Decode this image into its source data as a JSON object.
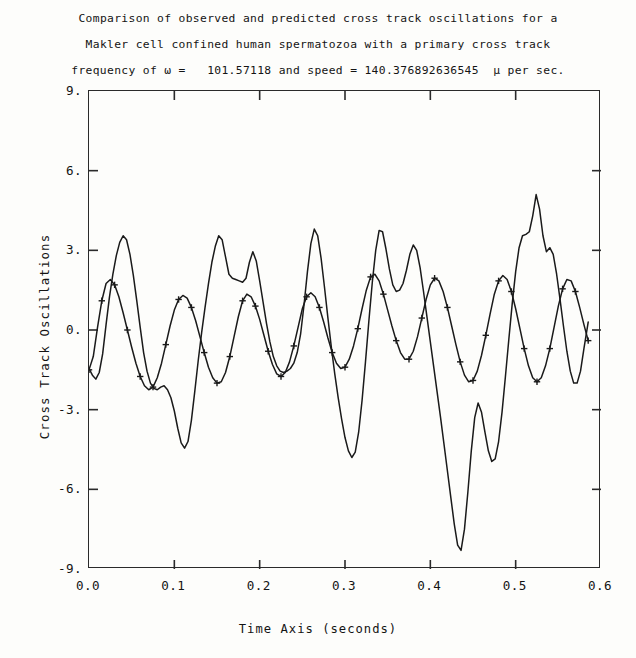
{
  "title": {
    "line1": "Comparison of observed and predicted cross track oscillations for a",
    "line2": "Makler cell confined human spermatozoa with a primary cross track",
    "line3": "frequency of ω =   101.57118 and speed = 140.376892636545  μ per sec."
  },
  "chart_data": {
    "type": "line",
    "xlabel": "Time Axis (seconds)",
    "ylabel": "Cross Track Oscillations",
    "xlim": [
      0.0,
      0.6
    ],
    "ylim": [
      -9.0,
      9.0
    ],
    "grid": false,
    "legend": "none",
    "xticks": [
      "0.0",
      "0.1",
      "0.2",
      "0.3",
      "0.4",
      "0.5",
      "0.6"
    ],
    "xtick_values": [
      0.0,
      0.1,
      0.2,
      0.3,
      0.4,
      0.5,
      0.6
    ],
    "yticks": [
      "9.",
      "6.",
      "3.",
      "0.",
      "-3.",
      "-6.",
      "-9."
    ],
    "ytick_values": [
      9,
      6,
      3,
      0,
      -3,
      -6,
      -9
    ],
    "frequency_omega": 101.57118,
    "speed": 140.376892636545,
    "speed_units": "μ per sec.",
    "series": [
      {
        "name": "observed",
        "marker": "none",
        "color": "#1a1a1a",
        "x": [
          0.0,
          0.004,
          0.008,
          0.012,
          0.016,
          0.02,
          0.024,
          0.028,
          0.032,
          0.036,
          0.04,
          0.044,
          0.048,
          0.052,
          0.056,
          0.06,
          0.064,
          0.068,
          0.072,
          0.076,
          0.08,
          0.084,
          0.088,
          0.092,
          0.096,
          0.1,
          0.104,
          0.108,
          0.112,
          0.116,
          0.12,
          0.124,
          0.128,
          0.132,
          0.136,
          0.14,
          0.144,
          0.148,
          0.152,
          0.156,
          0.16,
          0.164,
          0.168,
          0.172,
          0.176,
          0.18,
          0.184,
          0.188,
          0.192,
          0.196,
          0.2,
          0.204,
          0.208,
          0.212,
          0.216,
          0.22,
          0.224,
          0.228,
          0.232,
          0.236,
          0.24,
          0.244,
          0.248,
          0.252,
          0.256,
          0.26,
          0.264,
          0.268,
          0.272,
          0.276,
          0.28,
          0.284,
          0.288,
          0.292,
          0.296,
          0.3,
          0.304,
          0.308,
          0.312,
          0.316,
          0.32,
          0.324,
          0.328,
          0.332,
          0.336,
          0.34,
          0.344,
          0.348,
          0.352,
          0.356,
          0.36,
          0.364,
          0.368,
          0.372,
          0.376,
          0.38,
          0.384,
          0.388,
          0.392,
          0.396,
          0.4,
          0.404,
          0.408,
          0.412,
          0.416,
          0.42,
          0.424,
          0.428,
          0.432,
          0.436,
          0.44,
          0.444,
          0.448,
          0.452,
          0.456,
          0.46,
          0.464,
          0.468,
          0.472,
          0.476,
          0.48,
          0.484,
          0.488,
          0.492,
          0.496,
          0.5,
          0.504,
          0.508,
          0.512,
          0.516,
          0.52,
          0.524,
          0.528,
          0.532,
          0.536,
          0.54,
          0.544,
          0.548,
          0.552,
          0.556,
          0.56,
          0.564,
          0.568,
          0.572,
          0.576,
          0.58,
          0.585
        ],
        "y": [
          -1.45,
          -1.7,
          -1.85,
          -1.6,
          -0.9,
          0.2,
          1.25,
          2.1,
          2.8,
          3.3,
          3.55,
          3.4,
          2.85,
          2.05,
          1.1,
          0.1,
          -0.85,
          -1.55,
          -2.0,
          -2.2,
          -2.25,
          -2.15,
          -2.1,
          -2.25,
          -2.55,
          -3.05,
          -3.7,
          -4.25,
          -4.45,
          -4.2,
          -3.4,
          -2.3,
          -1.15,
          -0.1,
          0.85,
          1.75,
          2.55,
          3.15,
          3.55,
          3.4,
          2.75,
          2.1,
          1.95,
          1.9,
          1.85,
          1.8,
          1.95,
          2.55,
          2.95,
          2.6,
          1.85,
          1.05,
          0.25,
          -0.45,
          -1.0,
          -1.35,
          -1.55,
          -1.6,
          -1.55,
          -1.45,
          -1.25,
          -0.85,
          -0.15,
          0.95,
          2.2,
          3.25,
          3.8,
          3.55,
          2.7,
          1.6,
          0.45,
          -0.65,
          -1.65,
          -2.55,
          -3.35,
          -4.05,
          -4.55,
          -4.8,
          -4.6,
          -3.85,
          -2.65,
          -1.2,
          0.35,
          1.8,
          3.0,
          3.75,
          3.7,
          3.05,
          2.3,
          1.7,
          1.45,
          1.5,
          1.75,
          2.25,
          2.85,
          3.2,
          3.0,
          2.35,
          1.45,
          0.5,
          -0.45,
          -1.4,
          -2.35,
          -3.3,
          -4.3,
          -5.3,
          -6.3,
          -7.3,
          -8.1,
          -8.3,
          -7.5,
          -6.1,
          -4.55,
          -3.3,
          -2.75,
          -3.1,
          -3.85,
          -4.55,
          -4.95,
          -4.85,
          -4.2,
          -3.1,
          -1.75,
          -0.35,
          1.0,
          2.2,
          3.1,
          3.55,
          3.6,
          3.7,
          4.3,
          5.1,
          4.55,
          3.55,
          2.95,
          3.1,
          2.85,
          2.1,
          1.15,
          0.15,
          -0.8,
          -1.55,
          -2.0,
          -2.0,
          -1.55,
          -0.7,
          0.3
        ]
      },
      {
        "name": "predicted",
        "marker": "plus",
        "color": "#1a1a1a",
        "x": [
          0.0,
          0.005,
          0.01,
          0.015,
          0.02,
          0.025,
          0.03,
          0.035,
          0.04,
          0.045,
          0.05,
          0.055,
          0.06,
          0.065,
          0.07,
          0.075,
          0.08,
          0.085,
          0.09,
          0.095,
          0.1,
          0.105,
          0.11,
          0.115,
          0.12,
          0.125,
          0.13,
          0.135,
          0.14,
          0.145,
          0.15,
          0.155,
          0.16,
          0.165,
          0.17,
          0.175,
          0.18,
          0.185,
          0.19,
          0.195,
          0.2,
          0.205,
          0.21,
          0.215,
          0.22,
          0.225,
          0.23,
          0.235,
          0.24,
          0.245,
          0.25,
          0.255,
          0.26,
          0.265,
          0.27,
          0.275,
          0.28,
          0.285,
          0.29,
          0.295,
          0.3,
          0.305,
          0.31,
          0.315,
          0.32,
          0.325,
          0.33,
          0.335,
          0.34,
          0.345,
          0.35,
          0.355,
          0.36,
          0.365,
          0.37,
          0.375,
          0.38,
          0.385,
          0.39,
          0.395,
          0.4,
          0.405,
          0.41,
          0.415,
          0.42,
          0.425,
          0.43,
          0.435,
          0.44,
          0.445,
          0.45,
          0.455,
          0.46,
          0.465,
          0.47,
          0.475,
          0.48,
          0.485,
          0.49,
          0.495,
          0.5,
          0.505,
          0.51,
          0.515,
          0.52,
          0.525,
          0.53,
          0.535,
          0.54,
          0.545,
          0.55,
          0.555,
          0.56,
          0.565,
          0.57,
          0.575,
          0.58,
          0.585
        ],
        "y": [
          -1.5,
          -1.0,
          0.1,
          1.1,
          1.75,
          1.9,
          1.7,
          1.25,
          0.65,
          0.0,
          -0.65,
          -1.25,
          -1.75,
          -2.1,
          -2.25,
          -2.15,
          -1.8,
          -1.25,
          -0.55,
          0.15,
          0.75,
          1.15,
          1.3,
          1.2,
          0.85,
          0.35,
          -0.25,
          -0.85,
          -1.4,
          -1.8,
          -2.0,
          -1.95,
          -1.6,
          -1.0,
          -0.25,
          0.5,
          1.1,
          1.35,
          1.25,
          0.9,
          0.4,
          -0.2,
          -0.8,
          -1.3,
          -1.65,
          -1.75,
          -1.6,
          -1.2,
          -0.6,
          0.1,
          0.8,
          1.25,
          1.4,
          1.25,
          0.85,
          0.3,
          -0.3,
          -0.85,
          -1.25,
          -1.45,
          -1.4,
          -1.1,
          -0.6,
          0.05,
          0.8,
          1.5,
          2.0,
          2.1,
          1.85,
          1.35,
          0.75,
          0.15,
          -0.4,
          -0.85,
          -1.1,
          -1.1,
          -0.8,
          -0.25,
          0.45,
          1.15,
          1.7,
          1.95,
          1.85,
          1.45,
          0.85,
          0.15,
          -0.55,
          -1.2,
          -1.7,
          -1.95,
          -1.9,
          -1.55,
          -0.95,
          -0.2,
          0.6,
          1.35,
          1.85,
          2.05,
          1.9,
          1.45,
          0.8,
          0.05,
          -0.7,
          -1.35,
          -1.8,
          -1.95,
          -1.8,
          -1.35,
          -0.7,
          0.1,
          0.9,
          1.55,
          1.9,
          1.85,
          1.45,
          0.85,
          0.2,
          -0.4
        ]
      }
    ]
  },
  "axes": {
    "x_label": "Time Axis (seconds)",
    "y_label": "Cross Track Oscillations"
  }
}
